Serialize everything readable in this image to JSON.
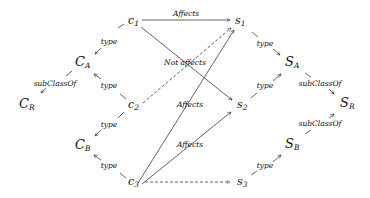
{
  "diagram": {
    "nodes": {
      "c1": {
        "base": "c",
        "sub": "1"
      },
      "c2": {
        "base": "c",
        "sub": "2"
      },
      "c3": {
        "base": "c",
        "sub": "3"
      },
      "s1": {
        "base": "s",
        "sub": "1"
      },
      "s2": {
        "base": "s",
        "sub": "2"
      },
      "s3": {
        "base": "s",
        "sub": "3"
      },
      "CA": {
        "base": "C",
        "sub": "A"
      },
      "CB": {
        "base": "C",
        "sub": "B"
      },
      "CR": {
        "base": "C",
        "sub": "R"
      },
      "SA": {
        "base": "S",
        "sub": "A"
      },
      "SB": {
        "base": "S",
        "sub": "B"
      },
      "SR": {
        "base": "S",
        "sub": "R"
      }
    },
    "edge_labels": {
      "c1_s1": "Affects",
      "c1_CA": "type",
      "c2_CA": "type",
      "c2_CB": "type",
      "c3_CB": "type",
      "CA_CR": "subClassOf",
      "c2_s1_dashed": "Not affects",
      "c3_s1": "Affects",
      "c3_s2": "Affects",
      "s1_SA": "type",
      "s2_SA": "type",
      "s3_SB": "type",
      "SA_SR": "subClassOf",
      "SB_SR": "subClassOf"
    },
    "edges": [
      {
        "from": "c1",
        "to": "s1",
        "label": "Affects",
        "style": "solid"
      },
      {
        "from": "c1",
        "to": "s2",
        "label": "",
        "style": "solid"
      },
      {
        "from": "c2",
        "to": "s1",
        "label": "Not affects",
        "style": "dashed"
      },
      {
        "from": "c3",
        "to": "s1",
        "label": "Affects",
        "style": "solid"
      },
      {
        "from": "c3",
        "to": "s2",
        "label": "Affects",
        "style": "solid"
      },
      {
        "from": "c3",
        "to": "s3",
        "label": "",
        "style": "dashed"
      },
      {
        "from": "c1",
        "to": "CA",
        "label": "type",
        "style": "solid"
      },
      {
        "from": "c2",
        "to": "CA",
        "label": "type",
        "style": "solid"
      },
      {
        "from": "c2",
        "to": "CB",
        "label": "type",
        "style": "solid"
      },
      {
        "from": "c3",
        "to": "CB",
        "label": "type",
        "style": "solid"
      },
      {
        "from": "CA",
        "to": "CR",
        "label": "subClassOf",
        "style": "solid"
      },
      {
        "from": "s1",
        "to": "SA",
        "label": "type",
        "style": "solid"
      },
      {
        "from": "s2",
        "to": "SA",
        "label": "type",
        "style": "solid"
      },
      {
        "from": "s3",
        "to": "SB",
        "label": "type",
        "style": "solid"
      },
      {
        "from": "SA",
        "to": "SR",
        "label": "subClassOf",
        "style": "solid"
      },
      {
        "from": "SB",
        "to": "SR",
        "label": "subClassOf",
        "style": "solid"
      }
    ],
    "colors": {
      "stroke": "#222222",
      "text": "#111111",
      "background": "#ffffff"
    }
  }
}
